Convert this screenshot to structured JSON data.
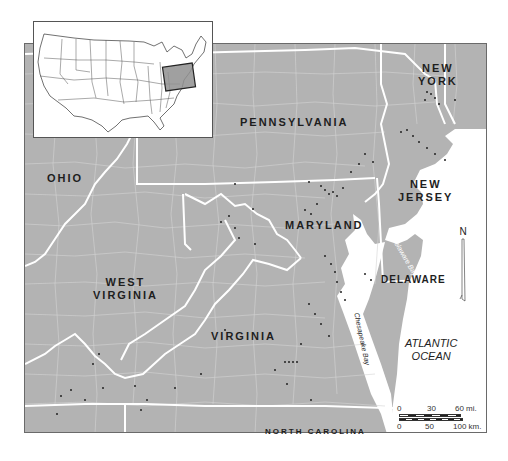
{
  "map": {
    "land_color": "#b3b3b3",
    "county_line_color": "#d6d6d6",
    "state_line_color": "#ffffff",
    "water_color": "#ffffff",
    "site_dot_color": "#222222"
  },
  "inset": {
    "label": "United States locator",
    "highlight_color": "#8f8f8f"
  },
  "states": {
    "new_york": "NEW YORK",
    "new_york_line1": "NEW",
    "new_york_line2": "YORK",
    "pennsylvania": "PENNSYLVANIA",
    "ohio": "OHIO",
    "new_jersey_line1": "NEW",
    "new_jersey_line2": "JERSEY",
    "maryland": "MARYLAND",
    "delaware": "DELAWARE",
    "west_virginia_line1": "WEST",
    "west_virginia_line2": "VIRGINIA",
    "virginia": "VIRGINIA",
    "north_carolina": "NORTH CAROLINA"
  },
  "water": {
    "atlantic_line1": "ATLANTIC",
    "atlantic_line2": "OCEAN",
    "delaware_bay_line1": "Delaware",
    "delaware_bay_line2": "Bay",
    "chesapeake_bay": "Chesapeake Bay"
  },
  "north_arrow": {
    "label": "N"
  },
  "scale_bar": {
    "miles": [
      "0",
      "30",
      "60 mi."
    ],
    "km": [
      "0",
      "50",
      "100 km."
    ]
  }
}
